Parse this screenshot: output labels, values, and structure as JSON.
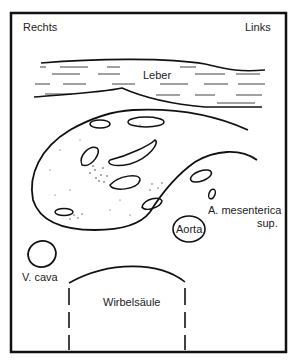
{
  "diagram": {
    "type": "anatomical cross-section (transverse abdomen)",
    "orientation": {
      "left_label": "Rechts",
      "right_label": "Links"
    },
    "labels": {
      "liver": "Leber",
      "aorta": "Aorta",
      "sma_line1": "A. mesenterica",
      "sma_line2": "sup.",
      "ivc": "V. cava",
      "spine": "Wirbelsäule"
    },
    "colors": {
      "stroke": "#111111",
      "background": "#ffffff",
      "text": "#222222"
    }
  }
}
